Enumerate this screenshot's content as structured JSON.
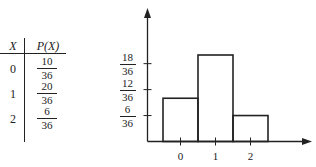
{
  "table": {
    "headers": [
      "X",
      "P(X)"
    ],
    "rows": [
      {
        "x": "0",
        "num": "10",
        "den": "36"
      },
      {
        "x": "1",
        "num": "20",
        "den": "36"
      },
      {
        "x": "2",
        "num": "6",
        "den": "36"
      }
    ]
  },
  "chart_data": {
    "type": "bar",
    "title": "",
    "xlabel": "",
    "ylabel": "",
    "categories": [
      "0",
      "1",
      "2"
    ],
    "values": [
      0.2778,
      0.5556,
      0.1667
    ],
    "values_fraction": [
      "10/36",
      "20/36",
      "6/36"
    ],
    "ylim": [
      0,
      0.75
    ],
    "yticks": [
      {
        "value": 0.1667,
        "num": "6",
        "den": "36"
      },
      {
        "value": 0.3333,
        "num": "12",
        "den": "36"
      },
      {
        "value": 0.5,
        "num": "18",
        "den": "36"
      }
    ],
    "xticks": [
      "0",
      "1",
      "2"
    ],
    "grid": false,
    "legend": "none",
    "style": "histogram with adjacent outlined bars, arrowed axes"
  },
  "colors": {
    "ink": "#222222",
    "background": "#ffffff"
  }
}
